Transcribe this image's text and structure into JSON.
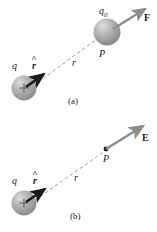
{
  "figure": {
    "background_color": "#ffffff",
    "ink_color": "#1a1a1a",
    "sphere_color": "#9a9a9a",
    "sphere_highlight": "#d8d8d8",
    "dashed_line_color": "#9b9b9b",
    "arrow_gray_color": "#8e8e8e",
    "arrow_black_color": "#1a1a1a"
  },
  "panels": [
    {
      "id": "a",
      "caption": "(a)",
      "source_charge_label": "q",
      "source_charge_sign": "+",
      "unit_vector_label": "r",
      "unit_vector_hat": "^",
      "distance_label": "r",
      "point_label": "P",
      "test_charge_label": "q",
      "test_charge_subscript": "0",
      "vector_label": "F"
    },
    {
      "id": "b",
      "caption": "(b)",
      "source_charge_label": "q",
      "source_charge_sign": "+",
      "unit_vector_label": "r",
      "unit_vector_hat": "^",
      "distance_label": "r",
      "point_label": "P",
      "vector_label": "E"
    }
  ]
}
